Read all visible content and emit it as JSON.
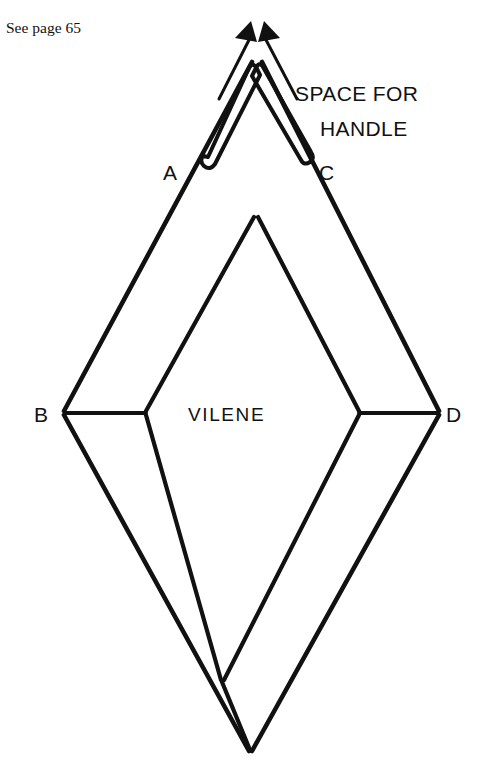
{
  "page": {
    "background_color": "#ffffff",
    "ink_color": "#111111",
    "width": 484,
    "height": 781
  },
  "annotations": {
    "cross_reference": "See page 65",
    "callout_line_1": "SPACE FOR",
    "callout_line_2": "HANDLE",
    "panel_material": "VILENE"
  },
  "vertex_labels": {
    "a": "A",
    "b": "B",
    "c": "C",
    "d": "D"
  },
  "geometry": {
    "outer_diamond": {
      "top": [
        255,
        57
      ],
      "left": [
        63,
        413
      ],
      "right": [
        440,
        413
      ],
      "bottom": [
        250,
        753
      ]
    },
    "inner_panel": {
      "apex": [
        256,
        216
      ],
      "left": [
        145,
        413
      ],
      "right": [
        360,
        413
      ],
      "bottom": [
        222,
        682
      ]
    },
    "handle_channel": {
      "apex": [
        254,
        62
      ],
      "left_end": [
        200,
        160
      ],
      "right_end": [
        311,
        157
      ],
      "width": 9
    },
    "arrow_heads": [
      {
        "tip": [
          249,
          22
        ],
        "direction": "up-left"
      },
      {
        "tip": [
          266,
          22
        ],
        "direction": "up-right"
      }
    ]
  },
  "icons": {
    "arrow_up_left": "arrow-up-left-icon",
    "arrow_up_right": "arrow-up-right-icon"
  }
}
